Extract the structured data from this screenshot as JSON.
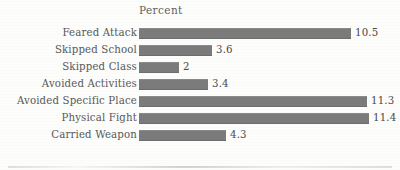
{
  "chart_data": {
    "type": "bar",
    "orientation": "horizontal",
    "title": "Percent",
    "xlabel": "",
    "ylabel": "",
    "categories": [
      "Feared Attack",
      "Skipped School",
      "Skipped Class",
      "Avoided Activities",
      "Avoided Specific Place",
      "Physical Fight",
      "Carried Weapon"
    ],
    "values": [
      10.5,
      3.6,
      2,
      3.4,
      11.3,
      11.4,
      4.3
    ],
    "value_labels": [
      "10.5",
      "3.6",
      "2",
      "3.4",
      "11.3",
      "11.4",
      "4.3"
    ],
    "xlim": [
      0,
      11.4
    ],
    "grid": false,
    "legend": false,
    "bar_color": "#7b7b7b",
    "background_color": "#fdfdfc"
  },
  "axis_labels": [
    {
      "text": "Feared Attack"
    },
    {
      "text": "Skipped School"
    },
    {
      "text": "Skipped Class"
    },
    {
      "text": "Avoided Activities"
    },
    {
      "text": "Avoided Specific Place"
    },
    {
      "text": "Physical Fight"
    },
    {
      "text": "Carried Weapon"
    }
  ],
  "data_labels": [
    {
      "text": "10.5"
    },
    {
      "text": "3.6"
    },
    {
      "text": "2"
    },
    {
      "text": "3.4"
    },
    {
      "text": "11.3"
    },
    {
      "text": "11.4"
    },
    {
      "text": "4.3"
    }
  ]
}
